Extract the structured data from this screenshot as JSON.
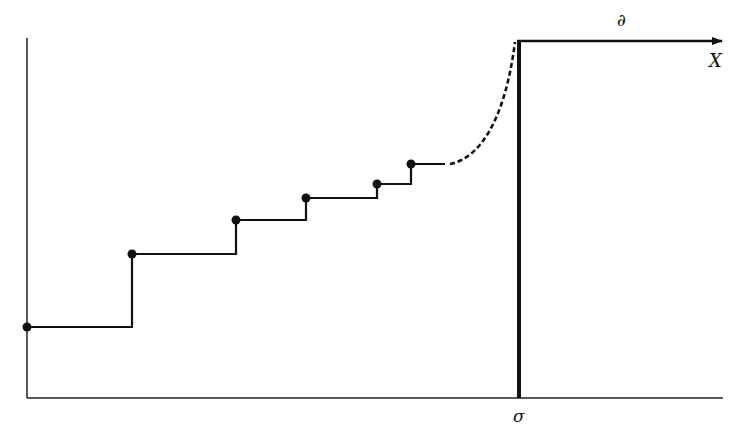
{
  "diagram": {
    "labels": {
      "partial": "∂",
      "x_axis": "X",
      "sigma": "σ"
    },
    "colors": {
      "ink": "#111111",
      "background": "#ffffff"
    },
    "step_points": [
      {
        "x": 27,
        "y": 327
      },
      {
        "x": 132,
        "y": 254
      },
      {
        "x": 236,
        "y": 220
      },
      {
        "x": 306,
        "y": 198
      },
      {
        "x": 377,
        "y": 184
      },
      {
        "x": 411,
        "y": 164
      }
    ]
  }
}
